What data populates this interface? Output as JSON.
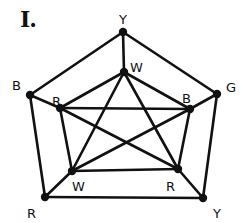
{
  "title": "I.",
  "colors": {
    "ink": "#111111",
    "background": "#ffffff"
  },
  "vertices": [
    {
      "id": "outer_top",
      "label": "Y",
      "x": 123,
      "y": 32,
      "lx": 119,
      "ly": 24
    },
    {
      "id": "outer_right",
      "label": "G",
      "x": 217,
      "y": 94,
      "lx": 226,
      "ly": 92
    },
    {
      "id": "outer_br",
      "label": "Y",
      "x": 203,
      "y": 198,
      "lx": 213,
      "ly": 218
    },
    {
      "id": "outer_bl",
      "label": "R",
      "x": 45,
      "y": 197,
      "lx": 27,
      "ly": 218
    },
    {
      "id": "outer_left",
      "label": "B",
      "x": 30,
      "y": 95,
      "lx": 12,
      "ly": 90
    },
    {
      "id": "inner_top",
      "label": "W",
      "x": 124,
      "y": 72,
      "lx": 130,
      "ly": 72
    },
    {
      "id": "inner_right",
      "label": "B",
      "x": 190,
      "y": 109,
      "lx": 182,
      "ly": 103
    },
    {
      "id": "inner_br",
      "label": "R",
      "x": 178,
      "y": 169,
      "lx": 166,
      "ly": 191
    },
    {
      "id": "inner_bl",
      "label": "W",
      "x": 72,
      "y": 171,
      "lx": 72,
      "ly": 191
    },
    {
      "id": "inner_left",
      "label": "R",
      "x": 60,
      "y": 108,
      "lx": 52,
      "ly": 106
    }
  ],
  "edges": [
    [
      "outer_top",
      "outer_right"
    ],
    [
      "outer_right",
      "outer_br"
    ],
    [
      "outer_br",
      "outer_bl"
    ],
    [
      "outer_bl",
      "outer_left"
    ],
    [
      "outer_left",
      "outer_top"
    ],
    [
      "outer_top",
      "inner_top"
    ],
    [
      "outer_right",
      "inner_right"
    ],
    [
      "outer_br",
      "inner_br"
    ],
    [
      "outer_bl",
      "inner_bl"
    ],
    [
      "outer_left",
      "inner_left"
    ],
    [
      "inner_top",
      "inner_left"
    ],
    [
      "inner_top",
      "inner_right"
    ],
    [
      "inner_left",
      "inner_bl"
    ],
    [
      "inner_right",
      "inner_br"
    ],
    [
      "inner_bl",
      "inner_br"
    ],
    [
      "inner_top",
      "inner_bl"
    ],
    [
      "inner_top",
      "inner_br"
    ],
    [
      "inner_left",
      "inner_right"
    ],
    [
      "inner_left",
      "inner_br"
    ],
    [
      "inner_right",
      "inner_bl"
    ]
  ]
}
